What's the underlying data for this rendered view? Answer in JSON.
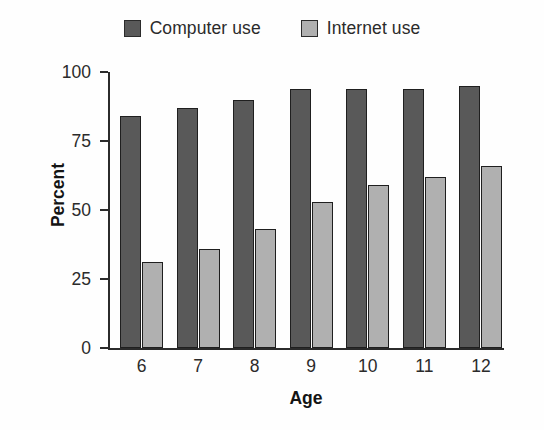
{
  "chart_data": {
    "type": "bar",
    "title": "",
    "xlabel": "Age",
    "ylabel": "Percent",
    "categories": [
      "6",
      "7",
      "8",
      "9",
      "10",
      "11",
      "12"
    ],
    "ylim": [
      0,
      100
    ],
    "yticks": [
      0,
      25,
      50,
      75,
      100
    ],
    "ytick_labels": [
      "0",
      "25",
      "50",
      "75",
      "100"
    ],
    "grid": false,
    "legend_position": "top-center",
    "series": [
      {
        "name": "Computer use",
        "color": "#595959",
        "values": [
          84,
          87,
          90,
          94,
          94,
          94,
          95
        ]
      },
      {
        "name": "Internet use",
        "color": "#b0b0b0",
        "values": [
          31,
          36,
          43,
          53,
          59,
          62,
          66
        ]
      }
    ]
  },
  "legend": {
    "entries": [
      {
        "label": "Computer use",
        "color": "#595959"
      },
      {
        "label": "Internet use",
        "color": "#b0b0b0"
      }
    ]
  },
  "axes": {
    "x_title": "Age",
    "y_title": "Percent"
  }
}
